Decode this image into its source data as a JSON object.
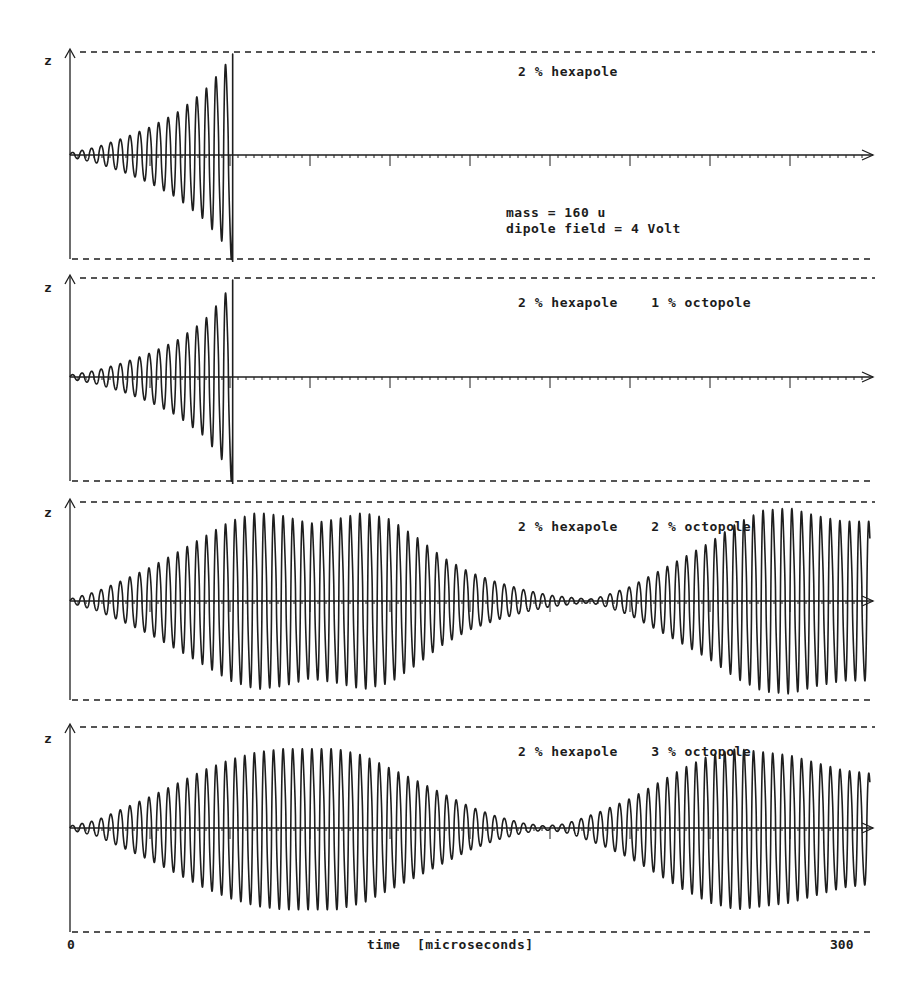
{
  "chart_data": [
    {
      "type": "line",
      "panel": 1,
      "annotation": "2 % hexapole",
      "extra_annotations": [
        "mass = 160 u",
        "dipole field = 4 Volt"
      ],
      "ylabel": "z",
      "xlabel": "time [microseconds]",
      "xlim": [
        0,
        300
      ],
      "description": "Oscillation amplitude grows steadily until the ion is ejected at ~61 microseconds",
      "ejected_at": 61,
      "envelope": {
        "t": [
          0,
          10,
          20,
          30,
          40,
          50,
          58,
          61
        ],
        "amplitude": [
          0.02,
          0.08,
          0.17,
          0.28,
          0.42,
          0.62,
          0.85,
          1.0
        ]
      }
    },
    {
      "type": "line",
      "panel": 2,
      "annotation": "2 % hexapole    1 % octopole",
      "ylabel": "z",
      "xlim": [
        0,
        300
      ],
      "description": "Amplitude grows until ejection at ~61 microseconds",
      "ejected_at": 61,
      "envelope": {
        "t": [
          0,
          10,
          20,
          30,
          40,
          50,
          58,
          61
        ],
        "amplitude": [
          0.02,
          0.07,
          0.15,
          0.25,
          0.38,
          0.57,
          0.82,
          1.0
        ]
      }
    },
    {
      "type": "line",
      "panel": 3,
      "annotation": "2 % hexapole    2 % octopole",
      "ylabel": "z",
      "xlim": [
        0,
        300
      ],
      "description": "Beat-like envelope: amplitude grows, saturates, decays to near zero around 195 microseconds, then grows again (no ejection)",
      "envelope": {
        "t": [
          0,
          10,
          20,
          30,
          40,
          50,
          60,
          70,
          80,
          90,
          100,
          110,
          120,
          130,
          140,
          150,
          160,
          170,
          180,
          190,
          195,
          200,
          210,
          220,
          230,
          240,
          250,
          260,
          270,
          280,
          290,
          300
        ],
        "amplitude": [
          0.02,
          0.1,
          0.22,
          0.35,
          0.5,
          0.65,
          0.8,
          0.88,
          0.85,
          0.78,
          0.82,
          0.88,
          0.82,
          0.65,
          0.45,
          0.3,
          0.2,
          0.12,
          0.06,
          0.03,
          0.02,
          0.05,
          0.15,
          0.3,
          0.45,
          0.6,
          0.78,
          0.9,
          0.92,
          0.85,
          0.8,
          0.8
        ]
      }
    },
    {
      "type": "line",
      "panel": 4,
      "annotation": "2 % hexapole    3 % octopole",
      "ylabel": "z",
      "xlim": [
        0,
        300
      ],
      "description": "Beat-like envelope with shorter period: minimum around 178 microseconds, then grows again",
      "envelope": {
        "t": [
          0,
          10,
          20,
          30,
          40,
          50,
          60,
          70,
          80,
          90,
          100,
          110,
          120,
          130,
          140,
          150,
          160,
          170,
          178,
          185,
          190,
          200,
          210,
          220,
          230,
          240,
          250,
          260,
          270,
          280,
          290,
          300
        ],
        "amplitude": [
          0.02,
          0.08,
          0.2,
          0.32,
          0.45,
          0.58,
          0.68,
          0.75,
          0.78,
          0.78,
          0.78,
          0.72,
          0.6,
          0.48,
          0.35,
          0.22,
          0.12,
          0.05,
          0.02,
          0.04,
          0.08,
          0.18,
          0.3,
          0.45,
          0.6,
          0.72,
          0.78,
          0.75,
          0.72,
          0.65,
          0.58,
          0.55
        ]
      }
    }
  ],
  "figure": {
    "x_axis": {
      "label": "time  [microseconds]",
      "min_label": "0",
      "max_label": "300",
      "major_tick_step": 30,
      "minor_tick_step": 3
    },
    "y_axis_label": "z",
    "oscillation_period_us": 3.6,
    "panels": [
      {
        "title": "2 % hexapole",
        "info_line1": "mass = 160 u",
        "info_line2": "dipole field = 4 Volt"
      },
      {
        "title": "2 % hexapole    1 % octopole"
      },
      {
        "title": "2 % hexapole    2 % octopole"
      },
      {
        "title": "2 % hexapole    3 % octopole"
      }
    ]
  }
}
